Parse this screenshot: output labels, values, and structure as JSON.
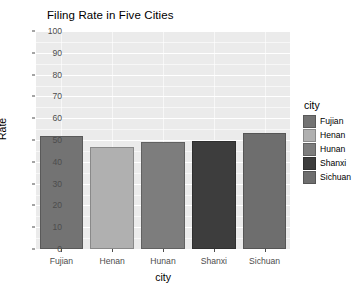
{
  "chart_data": {
    "type": "bar",
    "title": "Filing Rate in Five Cities",
    "xlabel": "city",
    "ylabel": "Rate",
    "categories": [
      "Fujian",
      "Henan",
      "Hunan",
      "Shanxi",
      "Sichuan"
    ],
    "values": [
      52,
      47,
      49,
      49.5,
      53
    ],
    "ylim": [
      0,
      100
    ],
    "yticks": [
      0,
      10,
      20,
      30,
      40,
      50,
      60,
      70,
      80,
      90,
      100
    ],
    "ytick_labels": [
      "0",
      "10",
      "20",
      "30",
      "40",
      "50",
      "60",
      "70",
      "80",
      "90",
      "100"
    ],
    "grid": true,
    "legend_position": "right",
    "legend_title": "city",
    "legend_entries": [
      {
        "label": "Fujian",
        "color": "#737373"
      },
      {
        "label": "Henan",
        "color": "#b0b0b0"
      },
      {
        "label": "Hunan",
        "color": "#7d7d7d"
      },
      {
        "label": "Shanxi",
        "color": "#3d3d3d"
      },
      {
        "label": "Sichuan",
        "color": "#6e6e6e"
      }
    ],
    "bar_colors": [
      "#737373",
      "#b0b0b0",
      "#7d7d7d",
      "#3d3d3d",
      "#6e6e6e"
    ],
    "panel_background": "#ebebeb",
    "gridline_color": "#ffffff",
    "plot_background": "#ffffff"
  }
}
